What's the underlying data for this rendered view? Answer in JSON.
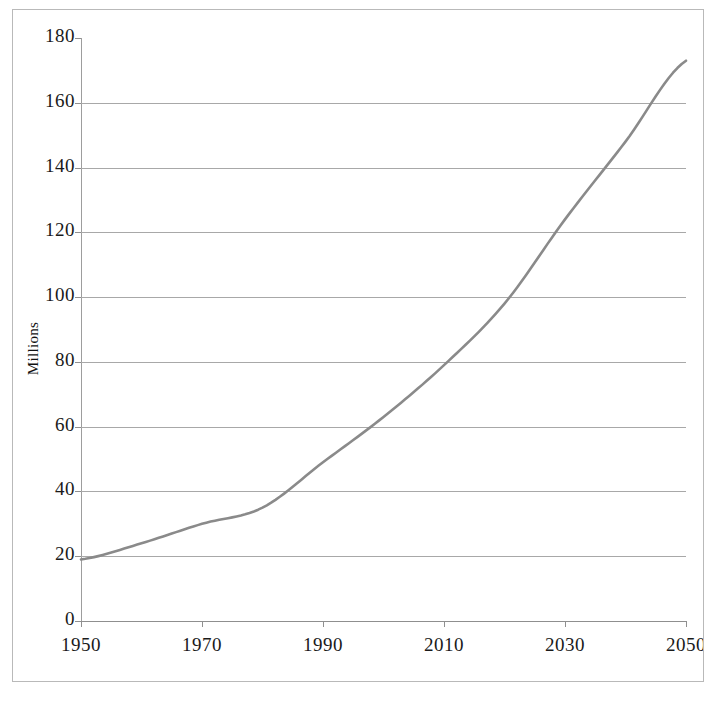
{
  "chart_data": {
    "type": "line",
    "title": "",
    "subtitle": "",
    "xlabel": "",
    "ylabel": "Millions",
    "xlim": [
      1950,
      2050
    ],
    "ylim": [
      0,
      180
    ],
    "grid": true,
    "legend": false,
    "legend_position": "none",
    "x_ticks": [
      "1950",
      "1970",
      "1990",
      "2010",
      "2030",
      "2050"
    ],
    "x_tick_values": [
      1950,
      1970,
      1990,
      2010,
      2030,
      2050
    ],
    "x_minor_tick_values": [
      1960,
      1980,
      2000,
      2020,
      2040
    ],
    "y_ticks": [
      "0",
      "20",
      "40",
      "60",
      "80",
      "100",
      "120",
      "140",
      "160",
      "180"
    ],
    "y_tick_values": [
      0,
      20,
      40,
      60,
      80,
      100,
      120,
      140,
      160,
      180
    ],
    "series": [
      {
        "name": "Population",
        "color": "#8a8a8a",
        "x": [
          1950,
          1960,
          1970,
          1980,
          1990,
          2000,
          2010,
          2020,
          2030,
          2040,
          2050
        ],
        "values": [
          19,
          24,
          30,
          35,
          49,
          63,
          79,
          98,
          124,
          148,
          173
        ]
      }
    ]
  },
  "axis_title": {
    "y": "Millions"
  },
  "colors": {
    "line": "#8a8a8a",
    "gridline": "#a8a8a8",
    "axis": "#8f8f8f",
    "frame": "#b9b9b9",
    "text": "#1a1a1a",
    "background": "#ffffff"
  }
}
